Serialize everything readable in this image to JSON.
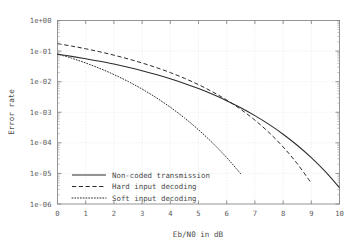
{
  "chart_data": {
    "type": "line",
    "title": "",
    "xlabel": "Eb/N0 in dB",
    "ylabel": "Error rate",
    "xlim": [
      0,
      10
    ],
    "ylim": [
      1e-06,
      1
    ],
    "yscale": "log",
    "xscale": "linear",
    "grid": true,
    "legend_position": "bottom-left",
    "xticks": [
      "0",
      "1",
      "2",
      "3",
      "4",
      "5",
      "6",
      "7",
      "8",
      "9",
      "10"
    ],
    "yticks": [
      "1e+00",
      "1e-01",
      "1e-02",
      "1e-03",
      "1e-04",
      "1e-05",
      "1e-06"
    ],
    "ytick_values": [
      1,
      0.1,
      0.01,
      0.001,
      0.0001,
      1e-05,
      1e-06
    ],
    "series": [
      {
        "name": "Non-coded transmission",
        "style": "solid",
        "x": [
          0,
          0.5,
          1,
          1.5,
          2,
          2.5,
          3,
          3.5,
          4,
          4.5,
          5,
          5.5,
          6,
          6.5,
          7,
          7.5,
          8,
          8.5,
          9,
          9.5,
          10
        ],
        "values": [
          0.0786,
          0.0671,
          0.0563,
          0.0463,
          0.0375,
          0.0296,
          0.0229,
          0.0172,
          0.0125,
          0.00878,
          0.00595,
          0.00387,
          0.00239,
          0.0014,
          0.000773,
          0.0004,
          0.000191,
          8.34e-05,
          3.28e-05,
          1.14e-05,
          3.4e-06
        ]
      },
      {
        "name": "Hard input decoding",
        "style": "dashed",
        "x": [
          0,
          0.5,
          1,
          1.5,
          2,
          2.5,
          3,
          3.5,
          4,
          4.5,
          5,
          5.5,
          6,
          6.5,
          7,
          7.5,
          8,
          8.5,
          9
        ],
        "values": [
          0.175,
          0.146,
          0.119,
          0.0947,
          0.0735,
          0.0556,
          0.0408,
          0.029,
          0.0198,
          0.0129,
          0.008,
          0.00464,
          0.00251,
          0.00124,
          0.000552,
          0.000217,
          7.35e-05,
          2.09e-05,
          4.8e-06
        ]
      },
      {
        "name": "Soft input decoding",
        "style": "dotted",
        "x": [
          0,
          0.5,
          1,
          1.5,
          2,
          2.5,
          3,
          3.5,
          4,
          4.5,
          5,
          5.5,
          6,
          6.5,
          7
        ],
        "values": [
          0.0802,
          0.0585,
          0.0408,
          0.0271,
          0.0171,
          0.0102,
          0.00572,
          0.003,
          0.00146,
          0.000653,
          0.000267,
          9.89e-05,
          3.29e-05,
          9.7e-06,
          9.5e-07
        ]
      }
    ]
  },
  "axis": {
    "x_title": "Eb/N0 in dB",
    "y_title": "Error rate"
  },
  "legend": {
    "items": [
      {
        "label": "Non-coded transmission",
        "style": "solid"
      },
      {
        "label": "Hard input decoding",
        "style": "dashed"
      },
      {
        "label": "Soft input decoding",
        "style": "dotted"
      }
    ]
  },
  "colors": {
    "background": "#ffffff",
    "curve": "#2b2b2b",
    "frame": "#8a8a8a",
    "grid": "#e2e2e2",
    "text": "#4a4a4a"
  }
}
